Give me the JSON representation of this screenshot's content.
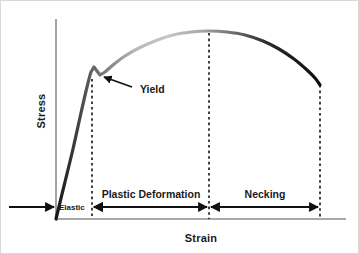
{
  "figure": {
    "kind": "stress-strain-curve-diagram",
    "background_color": "#ffffff",
    "border_color": "#d9d9d9"
  },
  "axes": {
    "y_label": "Stress",
    "x_label": "Strain",
    "axis_color": "#8c8c8c",
    "origin": {
      "x": 55,
      "y": 218
    },
    "x_axis_end": {
      "x": 345,
      "y": 218
    },
    "y_axis_top": {
      "x": 55,
      "y": 18
    }
  },
  "annotations": [
    {
      "name": "yield",
      "label": "Yield",
      "text_x": 136,
      "text_y": 92,
      "arrow_from": {
        "x": 131,
        "y": 86
      },
      "arrow_to": {
        "x": 101,
        "y": 75
      },
      "color": "#111111"
    }
  ],
  "regions": [
    {
      "name": "elastic",
      "label": "Elastic",
      "label_x": 58,
      "label_y": 207,
      "label_size": "small",
      "start_x": 8,
      "end_x": 55,
      "arrow_head": "right",
      "boundary_line_x": 91
    },
    {
      "name": "plastic-deformation",
      "label": "Plastic Deformation",
      "label_x": 150,
      "label_y": 196,
      "label_size": "normal",
      "start_x": 91,
      "end_x": 208,
      "arrow_head": "both",
      "boundary_line_x": 208
    },
    {
      "name": "necking",
      "label": "Necking",
      "label_x": 264,
      "label_y": 196,
      "label_size": "normal",
      "start_x": 208,
      "end_x": 319,
      "arrow_head": "both",
      "boundary_line_x": 319
    }
  ],
  "guide_lines": [
    {
      "name": "elastic-limit-line",
      "x": 91,
      "y_top": 78,
      "y_bottom": 218,
      "color": "#111111"
    },
    {
      "name": "uts-line",
      "x": 208,
      "y_top": 32,
      "y_bottom": 218,
      "color": "#111111"
    },
    {
      "name": "fracture-line",
      "x": 319,
      "y_top": 84,
      "y_bottom": 218,
      "color": "#111111"
    }
  ],
  "chart_data": {
    "type": "line",
    "title": "",
    "xlabel": "Strain",
    "ylabel": "Stress",
    "grid": false,
    "legend": "none",
    "axis_ticks": {
      "x": [],
      "y": []
    },
    "annotations": [
      "Yield"
    ],
    "regions": [
      "Elastic",
      "Plastic Deformation",
      "Necking"
    ],
    "series": [
      {
        "name": "engineering-stress-strain",
        "stroke_width": 3.2,
        "gradient": [
          {
            "offset": "0%",
            "color": "#141414"
          },
          {
            "offset": "16%",
            "color": "#6e6e6e"
          },
          {
            "offset": "30%",
            "color": "#b8b8b8"
          },
          {
            "offset": "42%",
            "color": "#c6c6c6"
          },
          {
            "offset": "55%",
            "color": "#a8a8a8"
          },
          {
            "offset": "68%",
            "color": "#6a6a6a"
          },
          {
            "offset": "80%",
            "color": "#2b2b2b"
          },
          {
            "offset": "100%",
            "color": "#0d0d0d"
          }
        ],
        "points": [
          {
            "x": 55,
            "y": 218
          },
          {
            "x": 63,
            "y": 185
          },
          {
            "x": 72,
            "y": 148
          },
          {
            "x": 80,
            "y": 112
          },
          {
            "x": 86,
            "y": 86
          },
          {
            "x": 90,
            "y": 71
          },
          {
            "x": 93,
            "y": 66
          },
          {
            "x": 96,
            "y": 70
          },
          {
            "x": 99,
            "y": 74
          },
          {
            "x": 104,
            "y": 71
          },
          {
            "x": 112,
            "y": 64
          },
          {
            "x": 124,
            "y": 55
          },
          {
            "x": 138,
            "y": 47
          },
          {
            "x": 154,
            "y": 40
          },
          {
            "x": 172,
            "y": 34
          },
          {
            "x": 190,
            "y": 31
          },
          {
            "x": 208,
            "y": 30
          },
          {
            "x": 226,
            "y": 31
          },
          {
            "x": 244,
            "y": 34
          },
          {
            "x": 262,
            "y": 40
          },
          {
            "x": 278,
            "y": 48
          },
          {
            "x": 293,
            "y": 58
          },
          {
            "x": 306,
            "y": 69
          },
          {
            "x": 314,
            "y": 77
          },
          {
            "x": 319,
            "y": 84
          }
        ]
      }
    ]
  }
}
